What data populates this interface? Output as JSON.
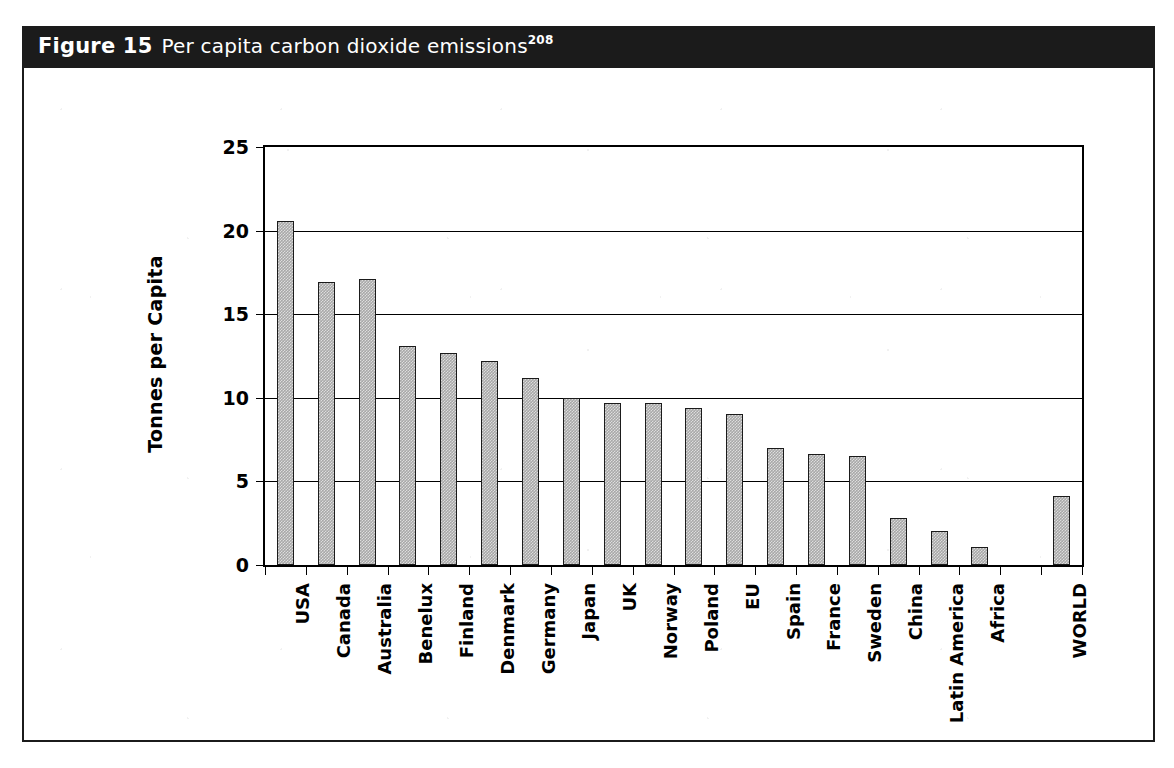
{
  "figure": {
    "label": "Figure 15",
    "caption": "Per capita carbon dioxide emissions",
    "superscript": "208",
    "title_bar_color": "#1b1b1b",
    "bar_fill_color": "#a8a8a8",
    "bar_edge_color": "#1b1b1b",
    "panel_background": "#ffffff"
  },
  "chart_data": {
    "type": "bar",
    "title": "Per capita carbon dioxide emissions",
    "xlabel": "",
    "ylabel": "Tonnes per Capita",
    "ylim": [
      0,
      25
    ],
    "yticks": [
      0,
      5,
      10,
      15,
      20,
      25
    ],
    "ytick_labels": [
      "0",
      "5",
      "10",
      "15",
      "20",
      "25"
    ],
    "grid": true,
    "legend": false,
    "categories": [
      "USA",
      "Canada",
      "Australia",
      "Benelux",
      "Finland",
      "Denmark",
      "Germany",
      "Japan",
      "UK",
      "Norway",
      "Poland",
      "EU",
      "Spain",
      "France",
      "Sweden",
      "China",
      "Latin America",
      "Africa",
      "WORLD"
    ],
    "values": [
      20.6,
      16.9,
      17.1,
      13.1,
      12.7,
      12.2,
      11.2,
      10.0,
      9.7,
      9.7,
      9.4,
      9.05,
      7.0,
      6.65,
      6.5,
      2.8,
      2.05,
      1.05,
      4.15
    ],
    "slots": [
      0,
      1,
      2,
      3,
      4,
      5,
      6,
      7,
      8,
      9,
      10,
      11,
      12,
      13,
      14,
      15,
      16,
      17,
      19
    ],
    "slot_count": 20,
    "units": "tonnes per capita"
  }
}
